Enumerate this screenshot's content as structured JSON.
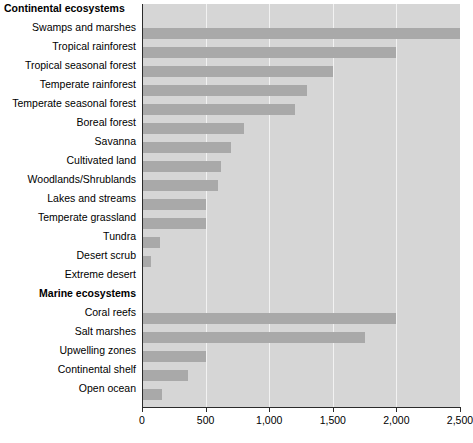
{
  "chart_data": {
    "type": "bar",
    "orientation": "horizontal",
    "title": "",
    "xlabel": "",
    "ylabel": "",
    "xlim": [
      0,
      2500
    ],
    "xticks": [
      0,
      500,
      1000,
      1500,
      2000,
      2500
    ],
    "xtick_labels": [
      "0",
      "500",
      "1,000",
      "1,500",
      "2,000",
      "2,500"
    ],
    "grid": true,
    "legend": false,
    "groups": [
      {
        "label": "Continental ecosystems",
        "bold": true,
        "align": "left",
        "categories": [
          "Swamps and marshes",
          "Tropical rainforest",
          "Tropical seasonal forest",
          "Temperate rainforest",
          "Temperate seasonal forest",
          "Boreal forest",
          "Savanna",
          "Cultivated land",
          "Woodlands/Shrublands",
          "Lakes and streams",
          "Temperate grassland",
          "Tundra",
          "Desert scrub",
          "Extreme desert"
        ],
        "values": [
          2500,
          2000,
          1500,
          1300,
          1200,
          800,
          700,
          620,
          600,
          500,
          500,
          140,
          70,
          10
        ]
      },
      {
        "label": "Marine ecosystems",
        "bold": true,
        "align": "right",
        "categories": [
          "Coral reefs",
          "Salt marshes",
          "Upwelling zones",
          "Continental shelf",
          "Open ocean"
        ],
        "values": [
          2000,
          1750,
          500,
          360,
          160
        ]
      }
    ],
    "colors": {
      "bar": "#a9a9a9",
      "plot_background": "#d6d6d6",
      "gridline": "#f2f2f2",
      "axis": "#2b2b2b",
      "text": "#000000"
    }
  }
}
